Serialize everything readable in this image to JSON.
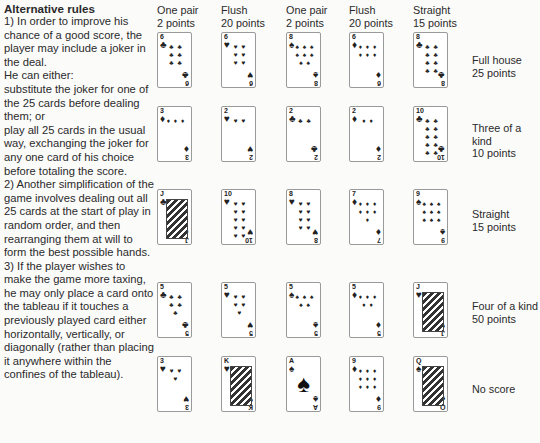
{
  "rules": {
    "title": "Alternative rules",
    "paragraphs": [
      "1) In order to improve his chance of a good score, the player may include a joker in the deal.",
      "He can either:",
      "substitute the joker for one of the 25 cards before dealing them; or",
      "play all 25 cards in the usual way, exchanging the joker for any one card of his choice before totaling the score.",
      "2) Another simplification of the game involves dealing out all 25 cards at the start of play in random order, and then rearranging them at will to form the best possible hands.",
      "3) If the player wishes to make the game more taxing, he may only place a card onto the tableau if it touches a previously played card either horizontally, vertically, or diagonally (rather than placing it anywhere within the confines of the tableau)."
    ]
  },
  "columns": [
    {
      "hand": "One pair",
      "score": "2 points"
    },
    {
      "hand": "Flush",
      "score": "20 points"
    },
    {
      "hand": "One pair",
      "score": "2 points"
    },
    {
      "hand": "Flush",
      "score": "20 points"
    },
    {
      "hand": "Straight",
      "score": "15 points"
    }
  ],
  "rows": [
    {
      "hand": "Full house",
      "score": "25 points"
    },
    {
      "hand": "Three of a kind",
      "score": "10 points"
    },
    {
      "hand": "Straight",
      "score": "15 points"
    },
    {
      "hand": "Four of a kind",
      "score": "50 points"
    },
    {
      "hand": "No score",
      "score": ""
    }
  ],
  "tableau": [
    [
      {
        "rank": "6",
        "suit": "♣"
      },
      {
        "rank": "6",
        "suit": "♥"
      },
      {
        "rank": "8",
        "suit": "♠"
      },
      {
        "rank": "6",
        "suit": "♦"
      },
      {
        "rank": "8",
        "suit": "♣"
      }
    ],
    [
      {
        "rank": "3",
        "suit": "♦"
      },
      {
        "rank": "2",
        "suit": "♥"
      },
      {
        "rank": "2",
        "suit": "♣"
      },
      {
        "rank": "2",
        "suit": "♦"
      },
      {
        "rank": "10",
        "suit": "♣"
      }
    ],
    [
      {
        "rank": "J",
        "suit": "♣"
      },
      {
        "rank": "10",
        "suit": "♥"
      },
      {
        "rank": "8",
        "suit": "♥"
      },
      {
        "rank": "7",
        "suit": "♦"
      },
      {
        "rank": "9",
        "suit": "♠"
      }
    ],
    [
      {
        "rank": "5",
        "suit": "♣"
      },
      {
        "rank": "5",
        "suit": "♥"
      },
      {
        "rank": "5",
        "suit": "♠"
      },
      {
        "rank": "5",
        "suit": "♦"
      },
      {
        "rank": "J",
        "suit": "♥"
      }
    ],
    [
      {
        "rank": "3",
        "suit": "♥"
      },
      {
        "rank": "K",
        "suit": "♥"
      },
      {
        "rank": "A",
        "suit": "♠"
      },
      {
        "rank": "9",
        "suit": "♦"
      },
      {
        "rank": "Q",
        "suit": "♠"
      }
    ]
  ]
}
